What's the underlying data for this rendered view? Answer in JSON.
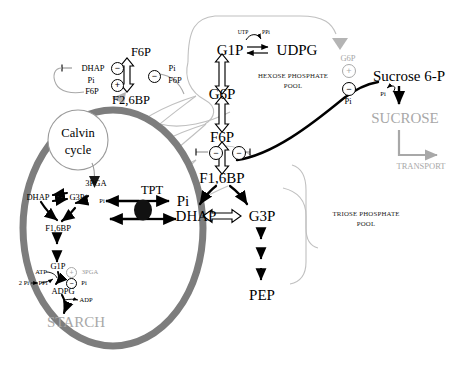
{
  "diagram": {
    "compartments": {
      "chloroplast_label": "Calvin cycle",
      "hexose_pool": "HEXOSE PHOSPHATE\nPOOL",
      "hexose_pool_line1": "HEXOSE PHOSPHATE",
      "hexose_pool_line2": "POOL",
      "triose_pool_line1": "TRIOSE PHOSPHATE",
      "triose_pool_line2": "POOL"
    },
    "colors": {
      "envelope": "#7d7d7d",
      "gray_text": "#a8a8a8",
      "black": "#000000",
      "background": "#ffffff",
      "gray_connector": "#bdbdbd"
    },
    "metabolites": {
      "f6p_top": "F6P",
      "f26bp": "F2,6BP",
      "dhap_reg": "DHAP",
      "pi_reg_left": "Pi",
      "f6p_reg_left": "F6P",
      "pi_reg_right": "Pi",
      "f6p_reg_right": "F6P",
      "g1p_cyt": "G1P",
      "udpg": "UDPG",
      "utp": "UTP",
      "ppi_cyt": "PPi",
      "g6p_cyt": "G6P",
      "f6p_cyt": "F6P",
      "f16bp_cyt": "F1,6BP",
      "dhap_cyt": "DHAP",
      "g3p_cyt": "G3P",
      "pep": "PEP",
      "g6p_reg": "G6P",
      "pi_reg_sps": "Pi",
      "sucrose_6p": "Sucrose 6-P",
      "sucrose": "SUCROSE",
      "pi_release": "Pi",
      "transport": "TRANSPORT",
      "calvin": "Calvin",
      "cycle": "cycle",
      "pga3_chl": "3PGA",
      "dhap_chl": "DHAP",
      "g3p_chl": "G3P",
      "f16bp_chl": "F1,6BP",
      "g1p_chl": "G1P",
      "adpg": "ADPG",
      "starch": "STARCH",
      "atp": "ATP",
      "two_pi": "2 Pi",
      "ppi_chl": "PPi",
      "adp": "ADP",
      "pga3_reg": "3PGA",
      "pi_reg_agpase": "Pi",
      "tpt": "TPT",
      "pi_stroma": "Pi",
      "pi_cytosol": "Pi",
      "dhap_tpt": "DHAP"
    },
    "symbols": {
      "minus": "−",
      "plus": "+"
    },
    "regulation": [
      {
        "name": "f26bp-inhibition-dhap",
        "sign": "minus",
        "effector": "DHAP"
      },
      {
        "name": "f26bp-activation-pi-f6p",
        "sign": "plus",
        "effector": "Pi, F6P"
      },
      {
        "name": "f26bp-inhibition-right",
        "sign": "minus",
        "effector": "Pi, F6P"
      },
      {
        "name": "fbpase-inhibition-left",
        "sign": "minus",
        "effector": "F2,6BP"
      },
      {
        "name": "fbpase-inhibition-right",
        "sign": "minus",
        "effector": "F2,6BP"
      },
      {
        "name": "sps-activation-g6p",
        "sign": "plus",
        "effector": "G6P"
      },
      {
        "name": "sps-inhibition-pi",
        "sign": "minus",
        "effector": "Pi"
      },
      {
        "name": "agpase-activation-3pga",
        "sign": "plus",
        "effector": "3PGA"
      },
      {
        "name": "agpase-inhibition-pi",
        "sign": "minus",
        "effector": "Pi"
      }
    ]
  }
}
